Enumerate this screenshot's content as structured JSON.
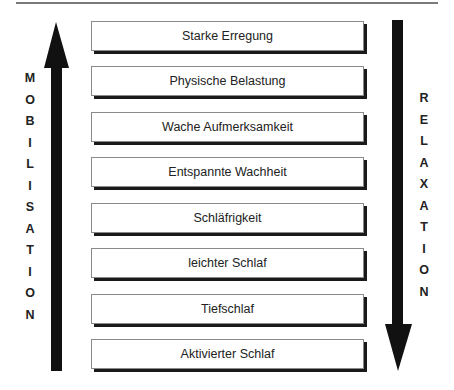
{
  "diagram": {
    "left_axis_label": "MOBILISATION",
    "right_axis_label": "RELAXATION",
    "left_arrow_direction": "up",
    "right_arrow_direction": "down",
    "states": [
      "Starke Erregung",
      "Physische Belastung",
      "Wache Aufmerksamkeit",
      "Entspannte Wachheit",
      "Schläfrigkeit",
      "leichter Schlaf",
      "Tiefschlaf",
      "Aktivierter Schlaf"
    ]
  },
  "left_letters": [
    "M",
    "O",
    "B",
    "I",
    "L",
    "I",
    "S",
    "A",
    "T",
    "I",
    "O",
    "N"
  ],
  "right_letters": [
    "R",
    "E",
    "L",
    "A",
    "X",
    "A",
    "T",
    "I",
    "O",
    "N"
  ]
}
